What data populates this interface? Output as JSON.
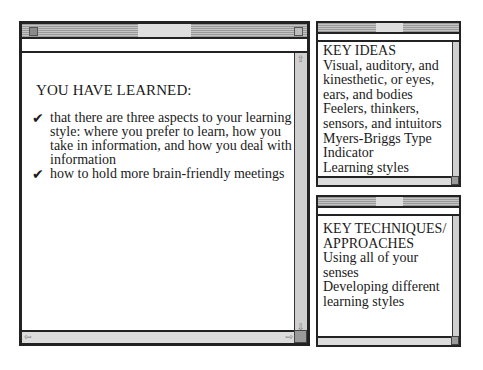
{
  "main_window": {
    "heading": "YOU HAVE LEARNED:",
    "bullets": [
      {
        "icon": "checkmark-icon",
        "glyph": "✔",
        "lines": [
          "that there are three aspects to your learning",
          "style: where you prefer to learn, how you",
          "take in information, and how you deal with",
          "information"
        ]
      },
      {
        "icon": "checkmark-icon",
        "glyph": "✔",
        "lines": [
          "how to hold more brain-friendly meetings"
        ]
      }
    ]
  },
  "key_ideas_window": {
    "heading": "KEY IDEAS",
    "lines": [
      "Visual, auditory, and",
      "kinesthetic, or eyes,",
      "ears, and bodies",
      "Feelers, thinkers,",
      "sensors, and intuitors",
      "Myers-Briggs Type",
      "Indicator",
      "Learning styles"
    ]
  },
  "key_techniques_window": {
    "heading_lines": [
      "KEY TECHNIQUES/",
      "APPROACHES"
    ],
    "lines": [
      "Using all of your",
      "senses",
      "Developing different",
      "learning styles"
    ]
  },
  "scroll_arrows": {
    "up": "⇧",
    "down": "⇩",
    "left": "⇦",
    "right": "⇨"
  }
}
